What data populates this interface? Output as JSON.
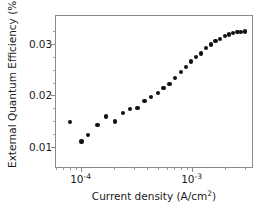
{
  "chart_data": {
    "type": "scatter",
    "title": "",
    "xlabel": "Current density (A/cm2)",
    "xlabel_parts": {
      "text": "Current density (A/cm",
      "sup": "2",
      "tail": ")"
    },
    "ylabel": "External Quantum Efficiency (%)",
    "xscale": "log",
    "yscale": "linear",
    "xlim": [
      6e-05,
      0.0035
    ],
    "ylim": [
      0.006,
      0.0355
    ],
    "grid": false,
    "legend": null,
    "xticks": [
      {
        "value": 0.0001,
        "label": "10-4",
        "mantissa": "10",
        "exponent": "-4"
      },
      {
        "value": 0.001,
        "label": "10-3",
        "mantissa": "10",
        "exponent": "-3"
      }
    ],
    "yticks": [
      {
        "value": 0.01,
        "label": "0.01"
      },
      {
        "value": 0.02,
        "label": "0.02"
      },
      {
        "value": 0.03,
        "label": "0.03"
      }
    ],
    "yticks_minor": [
      0.0125,
      0.015,
      0.0175,
      0.0225,
      0.025,
      0.0275,
      0.0325
    ],
    "marker": {
      "shape": "circle",
      "color": "#111111",
      "size_px": 4.4
    },
    "series": [
      {
        "name": "EQE vs current density",
        "x": [
          8e-05,
          0.000102,
          0.000117,
          0.000142,
          0.00017,
          0.000204,
          0.00024,
          0.00028,
          0.000325,
          0.000375,
          0.00043,
          0.000495,
          0.00056,
          0.00063,
          0.00071,
          0.0008,
          0.00089,
          0.00099,
          0.0011,
          0.00122,
          0.00135,
          0.00149,
          0.00164,
          0.00181,
          0.00199,
          0.00217,
          0.00237,
          0.00258,
          0.0028,
          0.00302
        ],
        "y": [
          0.0148,
          0.01095,
          0.01225,
          0.01415,
          0.0159,
          0.0149,
          0.0165,
          0.01735,
          0.01755,
          0.0189,
          0.01965,
          0.0204,
          0.0214,
          0.02225,
          0.0234,
          0.02455,
          0.02555,
          0.02665,
          0.0275,
          0.02815,
          0.0293,
          0.02995,
          0.03065,
          0.03105,
          0.03155,
          0.0319,
          0.03215,
          0.03235,
          0.0324,
          0.03245
        ]
      }
    ]
  }
}
